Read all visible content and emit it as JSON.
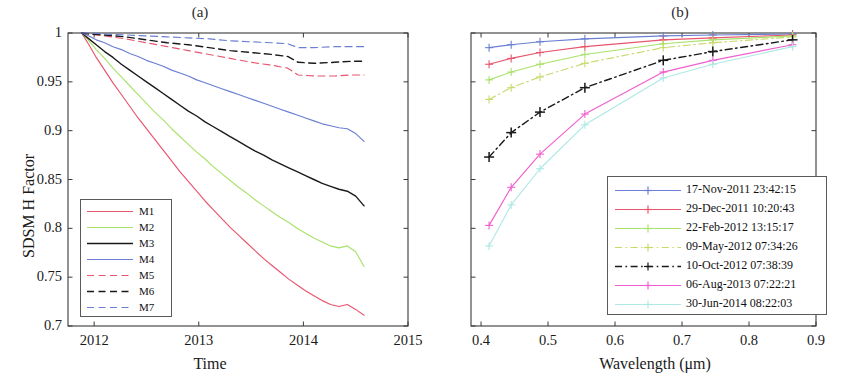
{
  "figure": {
    "panels": [
      {
        "id": "a",
        "title": "(a)"
      },
      {
        "id": "b",
        "title": "(b)"
      }
    ]
  },
  "chart_data": [
    {
      "type": "line",
      "panel": "a",
      "title": "(a)",
      "xlabel": "Time",
      "ylabel": "SDSM H Factor",
      "xlim": [
        2011.75,
        2015.0
      ],
      "ylim": [
        0.7,
        1.0
      ],
      "xticks": [
        2012,
        2013,
        2014,
        2015
      ],
      "xticklabels": [
        "2012",
        "2013",
        "2014",
        "2015"
      ],
      "yticks": [
        0.7,
        0.75,
        0.8,
        0.85,
        0.9,
        0.95,
        1
      ],
      "yticklabels": [
        "0.7",
        "0.75",
        "0.8",
        "0.85",
        "0.9",
        "0.95",
        "1"
      ],
      "grid": false,
      "legend_position": "lower-left",
      "series": [
        {
          "name": "M1",
          "color": "#e8556d",
          "style": "solid",
          "x": [
            2011.88,
            2011.95,
            2012.02,
            2012.1,
            2012.18,
            2012.26,
            2012.34,
            2012.42,
            2012.5,
            2012.58,
            2012.66,
            2012.74,
            2012.82,
            2012.9,
            2012.98,
            2013.06,
            2013.14,
            2013.22,
            2013.3,
            2013.38,
            2013.46,
            2013.54,
            2013.62,
            2013.7,
            2013.78,
            2013.86,
            2013.94,
            2014.02,
            2014.1,
            2014.18,
            2014.26,
            2014.34,
            2014.42,
            2014.5,
            2014.58
          ],
          "y": [
            1.0,
            0.988,
            0.975,
            0.962,
            0.949,
            0.937,
            0.925,
            0.913,
            0.902,
            0.891,
            0.88,
            0.869,
            0.858,
            0.848,
            0.838,
            0.828,
            0.819,
            0.81,
            0.801,
            0.793,
            0.785,
            0.777,
            0.769,
            0.762,
            0.755,
            0.748,
            0.742,
            0.736,
            0.731,
            0.726,
            0.722,
            0.72,
            0.722,
            0.717,
            0.711
          ]
        },
        {
          "name": "M2",
          "color": "#a9e26b",
          "style": "solid",
          "x": [
            2011.88,
            2011.95,
            2012.02,
            2012.1,
            2012.18,
            2012.26,
            2012.34,
            2012.42,
            2012.5,
            2012.58,
            2012.66,
            2012.74,
            2012.82,
            2012.9,
            2012.98,
            2013.06,
            2013.14,
            2013.22,
            2013.3,
            2013.38,
            2013.46,
            2013.54,
            2013.62,
            2013.7,
            2013.78,
            2013.86,
            2013.94,
            2014.02,
            2014.1,
            2014.18,
            2014.26,
            2014.34,
            2014.42,
            2014.5,
            2014.58
          ],
          "y": [
            1.0,
            0.992,
            0.983,
            0.974,
            0.964,
            0.955,
            0.946,
            0.937,
            0.928,
            0.919,
            0.911,
            0.902,
            0.894,
            0.886,
            0.878,
            0.871,
            0.863,
            0.856,
            0.849,
            0.842,
            0.836,
            0.829,
            0.823,
            0.817,
            0.811,
            0.806,
            0.8,
            0.795,
            0.79,
            0.786,
            0.782,
            0.78,
            0.782,
            0.776,
            0.761
          ]
        },
        {
          "name": "M3",
          "color": "#1a1a1a",
          "style": "solid",
          "x": [
            2011.88,
            2011.95,
            2012.02,
            2012.1,
            2012.18,
            2012.26,
            2012.34,
            2012.42,
            2012.5,
            2012.58,
            2012.66,
            2012.74,
            2012.82,
            2012.9,
            2012.98,
            2013.06,
            2013.14,
            2013.22,
            2013.3,
            2013.38,
            2013.46,
            2013.54,
            2013.62,
            2013.7,
            2013.78,
            2013.86,
            2013.94,
            2014.02,
            2014.1,
            2014.18,
            2014.26,
            2014.34,
            2014.42,
            2014.5,
            2014.58
          ],
          "y": [
            1.0,
            0.994,
            0.988,
            0.981,
            0.975,
            0.968,
            0.962,
            0.956,
            0.95,
            0.944,
            0.938,
            0.932,
            0.926,
            0.92,
            0.915,
            0.909,
            0.904,
            0.899,
            0.894,
            0.889,
            0.884,
            0.879,
            0.875,
            0.87,
            0.866,
            0.862,
            0.858,
            0.854,
            0.85,
            0.846,
            0.843,
            0.84,
            0.838,
            0.833,
            0.823
          ]
        },
        {
          "name": "M4",
          "color": "#6a7fd4",
          "style": "solid",
          "x": [
            2011.88,
            2011.95,
            2012.02,
            2012.1,
            2012.18,
            2012.26,
            2012.34,
            2012.42,
            2012.5,
            2012.58,
            2012.66,
            2012.74,
            2012.82,
            2012.9,
            2012.98,
            2013.06,
            2013.14,
            2013.22,
            2013.3,
            2013.38,
            2013.46,
            2013.54,
            2013.62,
            2013.7,
            2013.78,
            2013.86,
            2013.94,
            2014.02,
            2014.1,
            2014.18,
            2014.26,
            2014.34,
            2014.42,
            2014.5,
            2014.58
          ],
          "y": [
            1.0,
            0.997,
            0.993,
            0.99,
            0.986,
            0.983,
            0.979,
            0.976,
            0.972,
            0.969,
            0.966,
            0.962,
            0.959,
            0.956,
            0.952,
            0.949,
            0.946,
            0.943,
            0.94,
            0.937,
            0.934,
            0.931,
            0.928,
            0.925,
            0.922,
            0.919,
            0.916,
            0.913,
            0.91,
            0.907,
            0.905,
            0.903,
            0.902,
            0.897,
            0.889
          ]
        },
        {
          "name": "M5",
          "color": "#e8556d",
          "style": "dashed",
          "x": [
            2011.88,
            2011.95,
            2012.1,
            2012.3,
            2012.5,
            2012.7,
            2012.9,
            2013.1,
            2013.3,
            2013.5,
            2013.7,
            2013.85,
            2013.95,
            2014.1,
            2014.3,
            2014.45,
            2014.58
          ],
          "y": [
            1.0,
            0.999,
            0.997,
            0.994,
            0.99,
            0.986,
            0.982,
            0.978,
            0.974,
            0.97,
            0.967,
            0.964,
            0.957,
            0.956,
            0.956,
            0.957,
            0.957
          ]
        },
        {
          "name": "M6",
          "color": "#1a1a1a",
          "style": "dashed",
          "x": [
            2011.88,
            2011.95,
            2012.1,
            2012.3,
            2012.5,
            2012.7,
            2012.9,
            2013.1,
            2013.3,
            2013.5,
            2013.7,
            2013.85,
            2013.95,
            2014.1,
            2014.3,
            2014.45,
            2014.58
          ],
          "y": [
            1.0,
            0.999,
            0.998,
            0.996,
            0.993,
            0.99,
            0.988,
            0.985,
            0.982,
            0.98,
            0.978,
            0.976,
            0.97,
            0.969,
            0.97,
            0.971,
            0.971
          ]
        },
        {
          "name": "M7",
          "color": "#6a7fd4",
          "style": "dashed",
          "x": [
            2011.88,
            2011.95,
            2012.1,
            2012.3,
            2012.5,
            2012.7,
            2012.9,
            2013.1,
            2013.3,
            2013.5,
            2013.7,
            2013.85,
            2013.95,
            2014.1,
            2014.3,
            2014.45,
            2014.58
          ],
          "y": [
            1.0,
            1.0,
            0.999,
            0.998,
            0.997,
            0.996,
            0.995,
            0.994,
            0.992,
            0.991,
            0.99,
            0.989,
            0.985,
            0.985,
            0.986,
            0.986,
            0.986
          ]
        }
      ]
    },
    {
      "type": "line",
      "panel": "b",
      "title": "(b)",
      "xlabel": "Wavelength (μm)",
      "ylabel": "",
      "xlim": [
        0.385,
        0.9
      ],
      "ylim": [
        0.7,
        1.0
      ],
      "xticks": [
        0.4,
        0.5,
        0.6,
        0.7,
        0.8,
        0.9
      ],
      "xticklabels": [
        "0.4",
        "0.5",
        "0.6",
        "0.7",
        "0.8",
        "0.9"
      ],
      "yticks": [
        0.7,
        0.75,
        0.8,
        0.85,
        0.9,
        0.95,
        1
      ],
      "yticklabels": [],
      "grid": false,
      "legend_position": "lower-right",
      "marker": "plus",
      "series": [
        {
          "name": "17-Nov-2011 23:42:15",
          "color": "#6a7fd4",
          "style": "solid",
          "x": [
            0.412,
            0.445,
            0.488,
            0.555,
            0.672,
            0.746,
            0.865
          ],
          "y": [
            0.985,
            0.988,
            0.991,
            0.994,
            0.997,
            0.998,
            0.999
          ]
        },
        {
          "name": "29-Dec-2011 10:20:43",
          "color": "#e8556d",
          "style": "solid",
          "x": [
            0.412,
            0.445,
            0.488,
            0.555,
            0.672,
            0.746,
            0.865
          ],
          "y": [
            0.968,
            0.974,
            0.98,
            0.986,
            0.993,
            0.995,
            0.998
          ]
        },
        {
          "name": "22-Feb-2012 13:15:17",
          "color": "#a9e26b",
          "style": "solid",
          "x": [
            0.412,
            0.445,
            0.488,
            0.555,
            0.672,
            0.746,
            0.865
          ],
          "y": [
            0.952,
            0.96,
            0.968,
            0.978,
            0.989,
            0.993,
            0.997
          ]
        },
        {
          "name": "09-May-2012 07:34:26",
          "color": "#c8d96a",
          "style": "dashdot",
          "x": [
            0.412,
            0.445,
            0.488,
            0.555,
            0.672,
            0.746,
            0.865
          ],
          "y": [
            0.932,
            0.944,
            0.955,
            0.969,
            0.985,
            0.99,
            0.996
          ]
        },
        {
          "name": "10-Oct-2012 07:38:39",
          "color": "#1a1a1a",
          "style": "dashdot",
          "x": [
            0.412,
            0.445,
            0.488,
            0.555,
            0.672,
            0.746,
            0.865
          ],
          "y": [
            0.873,
            0.898,
            0.919,
            0.944,
            0.972,
            0.981,
            0.993
          ]
        },
        {
          "name": "06-Aug-2013 07:22:21",
          "color": "#f05fd0",
          "style": "solid",
          "x": [
            0.412,
            0.445,
            0.488,
            0.555,
            0.672,
            0.746,
            0.865
          ],
          "y": [
            0.803,
            0.842,
            0.876,
            0.917,
            0.96,
            0.972,
            0.988
          ]
        },
        {
          "name": "30-Jun-2014 08:22:03",
          "color": "#aee9e4",
          "style": "solid",
          "x": [
            0.412,
            0.445,
            0.488,
            0.555,
            0.672,
            0.746,
            0.865
          ],
          "y": [
            0.782,
            0.824,
            0.861,
            0.906,
            0.954,
            0.968,
            0.986
          ]
        }
      ]
    }
  ],
  "panelA": {
    "title": "(a)",
    "xlabel": "Time",
    "ylabel": "SDSM H Factor",
    "xticklabels": [
      "2012",
      "2013",
      "2014",
      "2015"
    ],
    "yticklabels": [
      "1",
      "0.95",
      "0.9",
      "0.85",
      "0.8",
      "0.75",
      "0.7"
    ],
    "legend": {
      "items": [
        {
          "label": "M1"
        },
        {
          "label": "M2"
        },
        {
          "label": "M3"
        },
        {
          "label": "M4"
        },
        {
          "label": "M5"
        },
        {
          "label": "M6"
        },
        {
          "label": "M7"
        }
      ]
    }
  },
  "panelB": {
    "title": "(b)",
    "xlabel": "Wavelength (μm)",
    "xticklabels": [
      "0.4",
      "0.5",
      "0.6",
      "0.7",
      "0.8",
      "0.9"
    ],
    "legend": {
      "items": [
        {
          "label": "17-Nov-2011 23:42:15"
        },
        {
          "label": "29-Dec-2011 10:20:43"
        },
        {
          "label": "22-Feb-2012 13:15:17"
        },
        {
          "label": "09-May-2012 07:34:26"
        },
        {
          "label": "10-Oct-2012 07:38:39"
        },
        {
          "label": "06-Aug-2013 07:22:21"
        },
        {
          "label": "30-Jun-2014 08:22:03"
        }
      ]
    }
  }
}
